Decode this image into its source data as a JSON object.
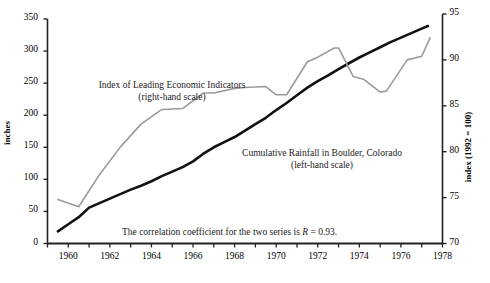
{
  "chart_data": {
    "type": "line",
    "title": "",
    "subtitle": "",
    "xlabel": "",
    "ylabel": "inches",
    "y2label": "index (1992 = 100)",
    "xlim": [
      1959,
      1978
    ],
    "ylim": [
      0,
      350
    ],
    "y2lim": [
      70,
      95
    ],
    "grid": false,
    "legend_position": "inline-annotations",
    "x_ticks": [
      1959,
      1960,
      1961,
      1962,
      1963,
      1964,
      1965,
      1966,
      1967,
      1968,
      1969,
      1970,
      1971,
      1972,
      1973,
      1974,
      1975,
      1976,
      1977,
      1978
    ],
    "x_tick_labels": [
      "",
      "1960",
      "",
      "1962",
      "",
      "1964",
      "",
      "1966",
      "",
      "1968",
      "",
      "1970",
      "",
      "1972",
      "",
      "1974",
      "",
      "1976",
      "",
      "1978"
    ],
    "y_ticks": [
      0,
      50,
      100,
      150,
      200,
      250,
      300,
      350
    ],
    "y_tick_labels": [
      "0",
      "50",
      "100",
      "150",
      "200",
      "250",
      "300",
      "350"
    ],
    "y2_ticks": [
      70,
      75,
      80,
      85,
      90,
      95
    ],
    "y2_tick_labels": [
      "70",
      "75",
      "80",
      "85",
      "90",
      "95"
    ],
    "annotations": [
      {
        "name": "correlation-note",
        "text": "The correlation coefficient for the two series is R = 0.93.",
        "prefix": "The correlation coefficient for the two series is ",
        "symbol": "R",
        "suffix": " = 0.93."
      }
    ],
    "series": [
      {
        "name": "Cumulative Rainfall in Boulder, Colorado",
        "label_line1": "Cumulative Rainfall in Boulder, Colorado",
        "label_line2": "(left-hand scale)",
        "axis": "left",
        "unit": "inches",
        "color": "#111111",
        "width": 2.6,
        "x": [
          1959.5,
          1960.0,
          1960.5,
          1961.0,
          1961.5,
          1962.0,
          1962.5,
          1963.0,
          1963.5,
          1964.0,
          1964.5,
          1965.0,
          1965.5,
          1966.0,
          1966.5,
          1967.0,
          1967.5,
          1968.0,
          1968.5,
          1969.0,
          1969.5,
          1970.0,
          1970.5,
          1971.0,
          1971.5,
          1972.0,
          1972.5,
          1973.0,
          1973.5,
          1974.0,
          1974.5,
          1975.0,
          1975.5,
          1976.0,
          1976.5,
          1977.0,
          1977.3
        ],
        "y": [
          19,
          30,
          41,
          56,
          63,
          70,
          77,
          84,
          90,
          97,
          105,
          112,
          119,
          128,
          140,
          150,
          158,
          166,
          176,
          186,
          196,
          208,
          219,
          231,
          243,
          253,
          262,
          272,
          281,
          290,
          298,
          306,
          314,
          321,
          328,
          335,
          339
        ]
      },
      {
        "name": "Index of Leading Economic Indicators",
        "label_line1": "Index of Leading Economic Indicators",
        "label_line2": "(right-hand scale)",
        "axis": "right",
        "unit": "index (1992 = 100)",
        "color": "#9a9a9a",
        "width": 1.6,
        "x": [
          1959.5,
          1960.5,
          1961.5,
          1962.5,
          1963.5,
          1964.5,
          1965.5,
          1966.5,
          1967.0,
          1968.0,
          1968.5,
          1969.5,
          1970.0,
          1970.5,
          1971.5,
          1972.0,
          1972.8,
          1973.0,
          1973.7,
          1974.2,
          1975.0,
          1975.3,
          1976.3,
          1977.0,
          1977.4
        ],
        "y": [
          74.8,
          74.0,
          77.5,
          80.5,
          83.0,
          84.6,
          84.7,
          86.4,
          86.4,
          86.9,
          87.0,
          87.1,
          86.2,
          86.2,
          89.8,
          90.3,
          91.3,
          91.3,
          88.2,
          87.9,
          86.5,
          86.6,
          90.0,
          90.4,
          92.4
        ]
      }
    ]
  },
  "axes": {
    "left_title": "inches",
    "right_title": "index (1992 = 100)"
  }
}
